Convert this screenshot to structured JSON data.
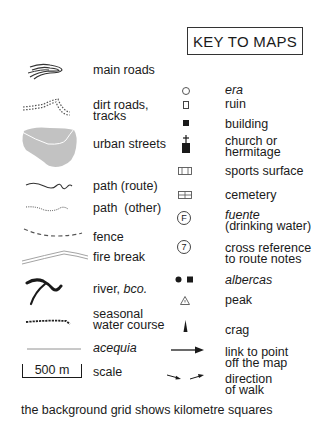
{
  "title": "KEY TO MAPS",
  "left_column": [
    {
      "id": "main-roads",
      "label": "main roads",
      "icon": "main-roads-icon"
    },
    {
      "id": "dirt-roads",
      "label_line1": "dirt roads,",
      "label_line2": "tracks",
      "icon": "dirt-roads-icon"
    },
    {
      "id": "urban-streets",
      "label": "urban streets",
      "icon": "urban-area-icon"
    },
    {
      "id": "path-route",
      "label": "path (route)",
      "icon": "path-route-icon"
    },
    {
      "id": "path-other",
      "label": "path  (other)",
      "icon": "path-other-icon"
    },
    {
      "id": "fence",
      "label": "fence",
      "icon": "fence-icon"
    },
    {
      "id": "fire-break",
      "label": "fire break",
      "icon": "fire-break-icon"
    },
    {
      "id": "river",
      "label_main": "river, ",
      "label_italic": "bco.",
      "icon": "river-icon"
    },
    {
      "id": "seasonal",
      "label_line1": "seasonal",
      "label_line2": "water course",
      "icon": "seasonal-water-icon"
    },
    {
      "id": "acequia",
      "label": "acequia",
      "icon": "acequia-icon"
    },
    {
      "id": "scale",
      "label": "scale",
      "scale_text": "500 m",
      "icon": "scale-bar-icon"
    }
  ],
  "right_column": [
    {
      "id": "era",
      "label": "era",
      "icon": "era-circle-icon"
    },
    {
      "id": "ruin",
      "label": "ruin",
      "icon": "ruin-icon"
    },
    {
      "id": "building",
      "label": "building",
      "icon": "building-icon"
    },
    {
      "id": "church",
      "label_line1": "church or",
      "label_line2": "hermitage",
      "icon": "church-icon"
    },
    {
      "id": "sports",
      "label": "sports surface",
      "icon": "sports-surface-icon"
    },
    {
      "id": "cemetery",
      "label": "cemetery",
      "icon": "cemetery-icon"
    },
    {
      "id": "fuente",
      "label_line1": "fuente",
      "label_line2": "(drinking water)",
      "icon_text": "F",
      "icon": "fuente-icon"
    },
    {
      "id": "crossref",
      "label_line1": "cross reference",
      "label_line2": "to route notes",
      "icon_text": "7",
      "icon": "cross-reference-icon"
    },
    {
      "id": "albercas",
      "label": "albercas",
      "icon": "albercas-icon"
    },
    {
      "id": "peak",
      "label": "peak",
      "icon": "peak-icon"
    },
    {
      "id": "crag",
      "label": "crag",
      "icon": "crag-icon"
    },
    {
      "id": "link",
      "label_line1": "link to point",
      "label_line2": "off the map",
      "icon": "arrow-link-icon"
    },
    {
      "id": "direction",
      "label_line1": "direction",
      "label_line2": "of walk",
      "icon": "direction-arrows-icon"
    }
  ],
  "footer": "the background grid shows kilometre squares",
  "colors": {
    "ink": "#1a1a1a",
    "urban_fill": "#bdbdbd",
    "grey_line": "#9a9a9a"
  }
}
